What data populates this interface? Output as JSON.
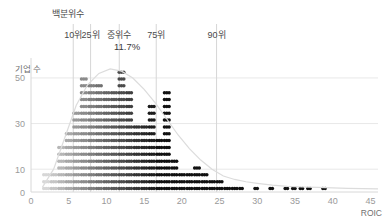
{
  "chart_data": {
    "type": "scatter",
    "title": "",
    "xlabel": "ROIC",
    "ylabel": "기업 수",
    "xlim": [
      0,
      46
    ],
    "ylim": [
      0,
      57
    ],
    "grid": true,
    "legend": null,
    "x_ticks": [
      "0",
      "5",
      "10",
      "15",
      "20",
      "25",
      "30",
      "35",
      "40",
      "45"
    ],
    "x_tick_values": [
      0,
      5,
      10,
      15,
      20,
      25,
      30,
      35,
      40,
      45
    ],
    "y_ticks": [
      "0",
      "10",
      "30",
      "50"
    ],
    "y_tick_values": [
      0,
      10,
      30,
      50
    ],
    "dots_per_row": 3,
    "bin_width": 1,
    "categories": [
      2,
      3,
      4,
      5,
      6,
      7,
      8,
      9,
      10,
      11,
      12,
      13,
      14,
      15,
      16,
      17,
      18,
      19,
      20,
      21,
      22,
      23,
      24,
      25,
      26,
      27,
      28,
      29,
      30,
      31,
      32,
      33,
      34,
      35,
      36,
      37,
      38,
      39,
      40,
      41,
      42,
      43,
      44,
      45
    ],
    "values": [
      9,
      9,
      21,
      27,
      36,
      51,
      48,
      48,
      45,
      45,
      54,
      45,
      30,
      30,
      39,
      24,
      45,
      15,
      9,
      9,
      12,
      9,
      6,
      6,
      3,
      3,
      2,
      0,
      2,
      0,
      2,
      0,
      2,
      2,
      2,
      2,
      0,
      2,
      1,
      0,
      1,
      0,
      0,
      0
    ],
    "series": [
      {
        "name": "기업 수 (dot density)",
        "values": [
          9,
          9,
          21,
          27,
          36,
          51,
          48,
          48,
          45,
          45,
          54,
          45,
          30,
          30,
          39,
          24,
          45,
          15,
          9,
          9,
          12,
          9,
          6,
          6,
          3,
          3,
          2,
          0,
          2,
          0,
          2,
          0,
          2,
          2,
          2,
          2,
          0,
          2,
          1,
          0,
          1,
          0,
          0,
          0
        ]
      },
      {
        "name": "밀도 곡선",
        "x": [
          1.5,
          3,
          4.5,
          6,
          7.5,
          9,
          10.5,
          12,
          13.5,
          15,
          16.5,
          18,
          19.5,
          21,
          22.5,
          24,
          25.5,
          27,
          28.5,
          30,
          32,
          34,
          36,
          38,
          40,
          42,
          44,
          46
        ],
        "values": [
          2,
          10,
          24,
          38,
          47,
          52,
          54,
          53,
          50,
          45,
          39,
          32,
          25,
          19,
          14,
          10,
          7,
          5.5,
          4.5,
          3.8,
          3,
          2.5,
          2.2,
          2,
          1.8,
          1.6,
          1.5,
          1.4
        ]
      }
    ]
  },
  "annotations": {
    "header": "백분위수",
    "markers": [
      {
        "id": "p10",
        "label": "10위",
        "x_value": 5.6
      },
      {
        "id": "p25",
        "label": "25위",
        "x_value": 7.9
      },
      {
        "id": "p50",
        "label": "중위수",
        "x_value": 11.7
      },
      {
        "id": "p75",
        "label": "75위",
        "x_value": 16.6
      },
      {
        "id": "p90",
        "label": "90위",
        "x_value": 24.6
      }
    ],
    "median_value": "11.7%"
  },
  "colors": {
    "background": "#ffffff",
    "grid": "#e8e8e8",
    "axis": "#d8d8d8",
    "tick_text": "#9a9a9a",
    "annotation_text": "#4a4a4a",
    "density_curve": "#dcdcdc",
    "dot_light": "#e2e2e2",
    "dot_dark": "#111111",
    "guide_line": "#d6d6d6"
  }
}
